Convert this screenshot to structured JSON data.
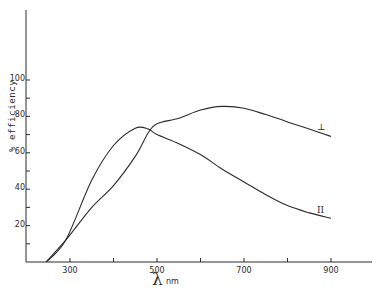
{
  "chart_data": {
    "type": "line",
    "title": "",
    "xlabel": "λ nm",
    "ylabel": "% efficiency",
    "xlim": [
      200,
      1000
    ],
    "ylim": [
      0,
      110
    ],
    "x_ticks": [
      300,
      400,
      500,
      600,
      700,
      800,
      900
    ],
    "x_tick_labels": [
      "300",
      "500",
      "700",
      "900"
    ],
    "y_ticks": [
      0,
      10,
      20,
      30,
      40,
      50,
      60,
      70,
      80,
      90,
      100
    ],
    "y_tick_labels": [
      "20",
      "40",
      "60",
      "80",
      "100"
    ],
    "grid": false,
    "legend": "inline curve labels at right end",
    "series": [
      {
        "name": "⊥",
        "x": [
          245,
          290,
          350,
          400,
          450,
          480,
          500,
          550,
          600,
          650,
          700,
          750,
          800,
          850,
          900
        ],
        "values": [
          0,
          12,
          30,
          42,
          58,
          71,
          76,
          79,
          83.5,
          85.5,
          84.5,
          81,
          77,
          73,
          69
        ]
      },
      {
        "name": "II",
        "x": [
          245,
          290,
          350,
          400,
          450,
          480,
          500,
          550,
          600,
          650,
          700,
          750,
          800,
          850,
          900
        ],
        "values": [
          0,
          12,
          45,
          64,
          73.5,
          73,
          70,
          65,
          59,
          51,
          44,
          37,
          31,
          27,
          24
        ]
      }
    ]
  },
  "labels": {
    "y_axis": "% efficiency",
    "x_axis_symbol": "λ",
    "x_axis_unit": "nm",
    "curve_perp": "⊥",
    "curve_par": "II"
  }
}
